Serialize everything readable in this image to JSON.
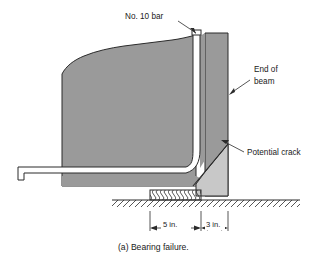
{
  "figure": {
    "caption": "(a) Bearing failure.",
    "annotations": {
      "bar_label": "No. 10 bar",
      "end_of_beam_line1": "End of",
      "end_of_beam_line2": "beam",
      "potential_crack_label": "Potential crack"
    },
    "dimensions": [
      {
        "label": "5 in.",
        "value": 5,
        "unit": "in."
      },
      {
        "label": "3 in.",
        "value": 3,
        "unit": "in."
      }
    ],
    "colors": {
      "concrete_main": "#9a9a9a",
      "concrete_wedge": "#c8c8c8",
      "rebar": "#ffffff",
      "outline": "#2b2b2b",
      "background": "#ffffff",
      "text": "#1a1a1a"
    },
    "parts": {
      "beam_body": "concrete beam end (broken/torn left edge)",
      "rebar_bar": "No. 10 hooked reinforcing bar",
      "wedge": "spalled concrete wedge below potential crack",
      "crack": "potential crack line",
      "bearing_pad": "bearing pad support",
      "ground": "support / ground hatch line"
    }
  }
}
